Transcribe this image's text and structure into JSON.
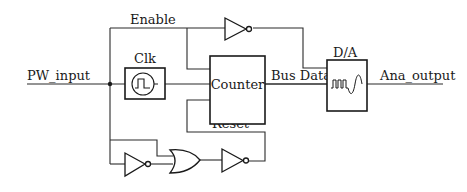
{
  "diagram": {
    "type": "circuit-block-diagram",
    "signals": {
      "input": "PW_input",
      "enable": "Enable",
      "bus": "Bus Data",
      "reset": "Reset",
      "output": "Ana_output"
    },
    "blocks": {
      "clock": {
        "label": "Clk",
        "icon": "square-wave-icon"
      },
      "counter": {
        "label": "Counter"
      },
      "dac": {
        "label": "D/A",
        "icon": "digital-to-analog-wave-icon"
      }
    },
    "gates": [
      {
        "id": "enable-inverter",
        "kind": "NOT"
      },
      {
        "id": "input-inverter",
        "kind": "NOT"
      },
      {
        "id": "reset-or",
        "kind": "OR"
      },
      {
        "id": "reset-inverter",
        "kind": "NOT"
      }
    ],
    "colors": {
      "line": "#1a1a1a",
      "background": "#ffffff"
    }
  }
}
